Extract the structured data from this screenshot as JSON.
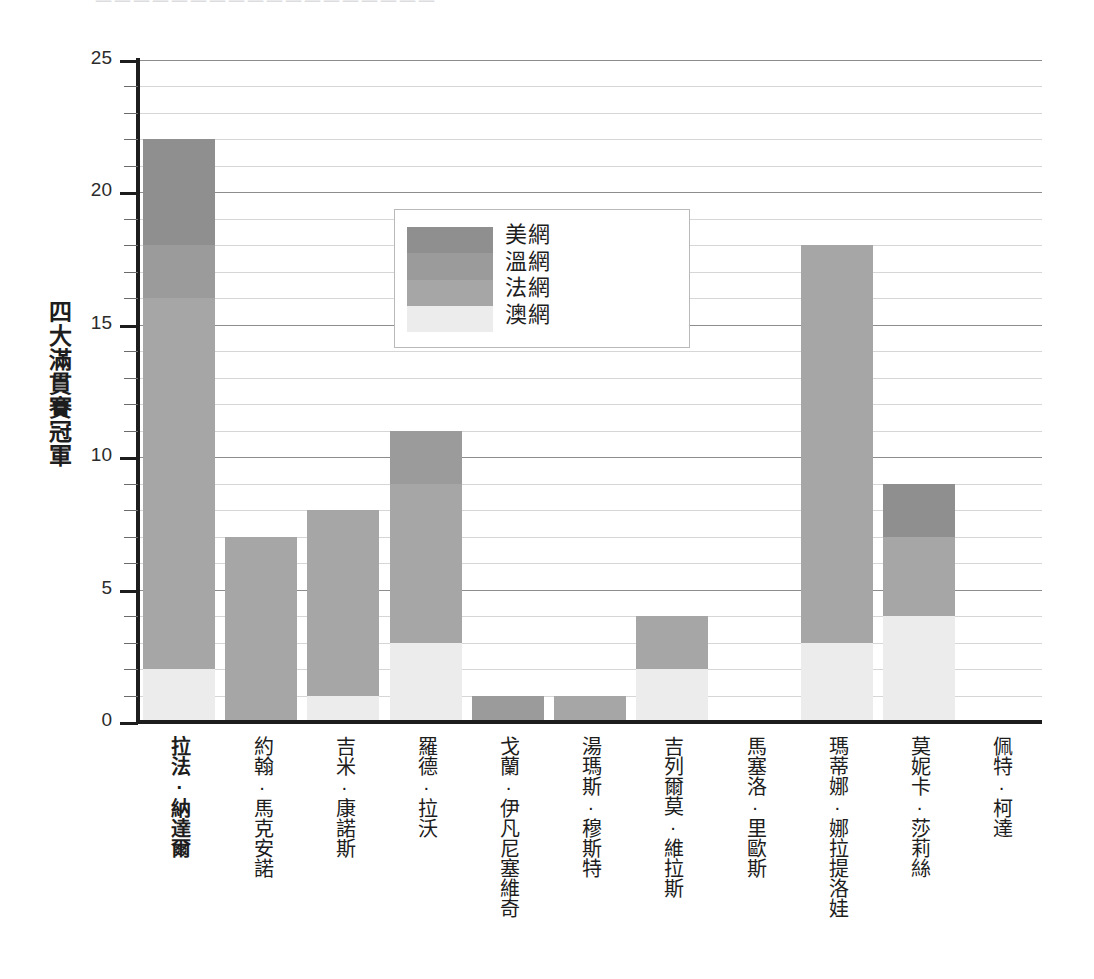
{
  "top_strip": {
    "ghost_text": "一一一一一一一一一一一一一一一一一一"
  },
  "chart_data": {
    "type": "bar",
    "stacked": true,
    "title": "",
    "xlabel": "",
    "ylabel": "四大滿貫賽冠軍",
    "ylim": [
      0,
      25
    ],
    "yticks": [
      0,
      5,
      10,
      15,
      20,
      25
    ],
    "ytick_labels": [
      "0",
      "5",
      "10",
      "15",
      "20",
      "25"
    ],
    "minor_tick_step": 1,
    "grid": true,
    "legend_position": "upper-center",
    "categories": [
      "拉法・納達爾",
      "約翰・馬克安諾",
      "吉米・康諾斯",
      "羅德・拉沃",
      "戈蘭・伊凡尼塞維奇",
      "湯瑪斯・穆斯特",
      "吉列爾莫・維拉斯",
      "馬塞洛・里歐斯",
      "瑪蒂娜・娜拉提洛娃",
      "莫妮卡・莎莉絲",
      "佩特・柯達"
    ],
    "category_labels": [
      "拉法·納達爾",
      "約翰·馬克安諾",
      "吉米·康諾斯",
      "羅德·拉沃",
      "戈蘭·伊凡尼塞維奇",
      "湯瑪斯·穆斯特",
      "吉列爾莫·維拉斯",
      "馬塞洛·里歐斯",
      "瑪蒂娜·娜拉提洛娃",
      "莫妮卡·莎莉絲",
      "佩特·柯達"
    ],
    "highlighted_category": "拉法·納達爾",
    "series": [
      {
        "name": "澳網",
        "color": "#ececec",
        "values": [
          2,
          0,
          1,
          3,
          0,
          0,
          2,
          0,
          3,
          4,
          0
        ]
      },
      {
        "name": "法網",
        "color": "#a6a6a6",
        "values": [
          14,
          7,
          7,
          6,
          0,
          1,
          2,
          0,
          15,
          3,
          0
        ]
      },
      {
        "name": "溫網",
        "color": "#9b9b9b",
        "values": [
          2,
          0,
          0,
          2,
          1,
          0,
          0,
          0,
          0,
          0,
          0
        ]
      },
      {
        "name": "美網",
        "color": "#8f8f8f",
        "values": [
          4,
          0,
          0,
          0,
          0,
          0,
          0,
          0,
          0,
          2,
          0
        ]
      }
    ],
    "totals": [
      22,
      7,
      8,
      11,
      1,
      1,
      4,
      0,
      18,
      9,
      0
    ],
    "legend_entries": [
      {
        "label": "美網",
        "color": "#8f8f8f"
      },
      {
        "label": "溫網",
        "color": "#9b9b9b"
      },
      {
        "label": "法網",
        "color": "#a6a6a6"
      },
      {
        "label": "澳網",
        "color": "#ececec"
      }
    ]
  },
  "colors": {
    "axis": "#1d1d1d",
    "gridline": "#d6d6d6",
    "gridline_major": "#8d8d8d",
    "background": "#ffffff",
    "text": "#1d1d1d"
  }
}
